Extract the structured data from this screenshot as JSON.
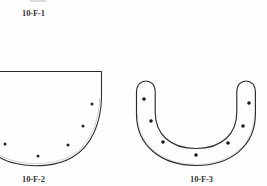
{
  "page": {
    "kind": "line-drawing-plate",
    "background_color": "#fefefe",
    "ink_color": "#2b2b2b",
    "width": 267,
    "height": 186
  },
  "labels": {
    "top": "10-F-1",
    "left": "10-F-2",
    "right": "10-F-3"
  },
  "figures": [
    {
      "id": "10-F-2",
      "name": "hemispherical-bowl-profile",
      "description": "Cross-section profile of a hemispherical bowl, cropped at the left edge of the plate. Straight horizontal rim line with a vertical rim wall on the right that curves into a rounded base. Five small filled dots mark temper / inclusion points inside the body.",
      "dot_count": 5,
      "dots": [
        {
          "cx": 92,
          "cy": 104,
          "r": 1.5
        },
        {
          "cx": 83,
          "cy": 126,
          "r": 1.5
        },
        {
          "cx": 68,
          "cy": 145,
          "r": 1.5
        },
        {
          "cx": 38,
          "cy": 156,
          "r": 1.5
        },
        {
          "cx": 5,
          "cy": 144,
          "r": 1.5
        }
      ]
    },
    {
      "id": "10-F-3",
      "name": "u-shaped-vessel-profile",
      "description": "Cross-section profile of a deep U-shaped (horseshoe-form) vessel wall drawn as a closed double outline with rounded rim terminals. Seven small filled dots are distributed along the wall band.",
      "dot_count": 7,
      "dots": [
        {
          "cx": 144,
          "cy": 99,
          "r": 1.8
        },
        {
          "cx": 151,
          "cy": 121,
          "r": 1.8
        },
        {
          "cx": 163,
          "cy": 142,
          "r": 1.8
        },
        {
          "cx": 196,
          "cy": 155,
          "r": 1.8
        },
        {
          "cx": 228,
          "cy": 143,
          "r": 1.8
        },
        {
          "cx": 243,
          "cy": 126,
          "r": 1.8
        },
        {
          "cx": 249,
          "cy": 103,
          "r": 1.8
        }
      ]
    }
  ]
}
